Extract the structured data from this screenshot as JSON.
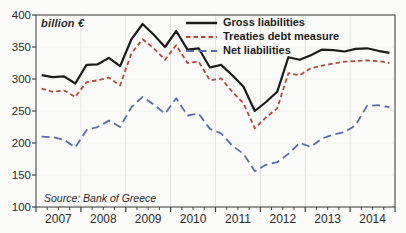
{
  "page": {
    "background": "#fbfbf9",
    "frame_color": "#555550",
    "grid_color": "#e4e4df",
    "hgrid_color": "#f0f0ec",
    "tick_color": "#44443f",
    "text_color": "#2b2b2b"
  },
  "chart": {
    "unit_label": "billion €",
    "source_note": "Source: Bank of Greece"
  },
  "chart_data": {
    "type": "line",
    "title": "",
    "ylabel": "billion €",
    "source": "Source: Bank of Greece",
    "x_unit": "quarter",
    "x_start": "2007-Q1",
    "x_end": "2014-Q4",
    "year_labels": [
      "2007",
      "2008",
      "2009",
      "2010",
      "2011",
      "2012",
      "2013",
      "2014"
    ],
    "y_ticks": [
      400,
      350,
      300,
      250,
      200,
      150,
      100
    ],
    "ylim": [
      100,
      400
    ],
    "grid": "faint vertical lines at year boundaries, very faint horizontal at 50s",
    "legend_position": "top-right inside plot",
    "legend": [
      "Gross liabilities",
      "Treaties debt measure",
      "Net liabilities"
    ],
    "series": [
      {
        "name": "Gross liabilities",
        "color": "#1c1c1c",
        "style": "solid",
        "dash": "",
        "width": 2.2,
        "values": [
          306,
          303,
          304,
          293,
          322,
          323,
          333,
          320,
          362,
          386,
          369,
          350,
          375,
          346,
          348,
          318,
          322,
          306,
          288,
          250,
          264,
          280,
          334,
          330,
          337,
          346,
          345,
          343,
          347,
          348,
          344,
          341
        ]
      },
      {
        "name": "Treaties debt measure",
        "color": "#b04a42",
        "style": "short-dash",
        "dash": "4.5,3",
        "width": 1.8,
        "values": [
          285,
          280,
          282,
          272,
          295,
          298,
          302,
          290,
          340,
          362,
          348,
          330,
          353,
          325,
          327,
          298,
          301,
          280,
          262,
          223,
          240,
          254,
          309,
          306,
          317,
          321,
          324,
          327,
          328,
          329,
          328,
          325
        ]
      },
      {
        "name": "Net liabilities",
        "color": "#5c6ba5",
        "style": "long-dash",
        "dash": "8,4.5",
        "width": 1.8,
        "values": [
          210,
          209,
          205,
          193,
          220,
          225,
          235,
          225,
          256,
          272,
          260,
          246,
          270,
          243,
          246,
          222,
          215,
          196,
          183,
          156,
          166,
          170,
          183,
          200,
          194,
          207,
          213,
          217,
          228,
          258,
          259,
          256
        ]
      }
    ]
  }
}
